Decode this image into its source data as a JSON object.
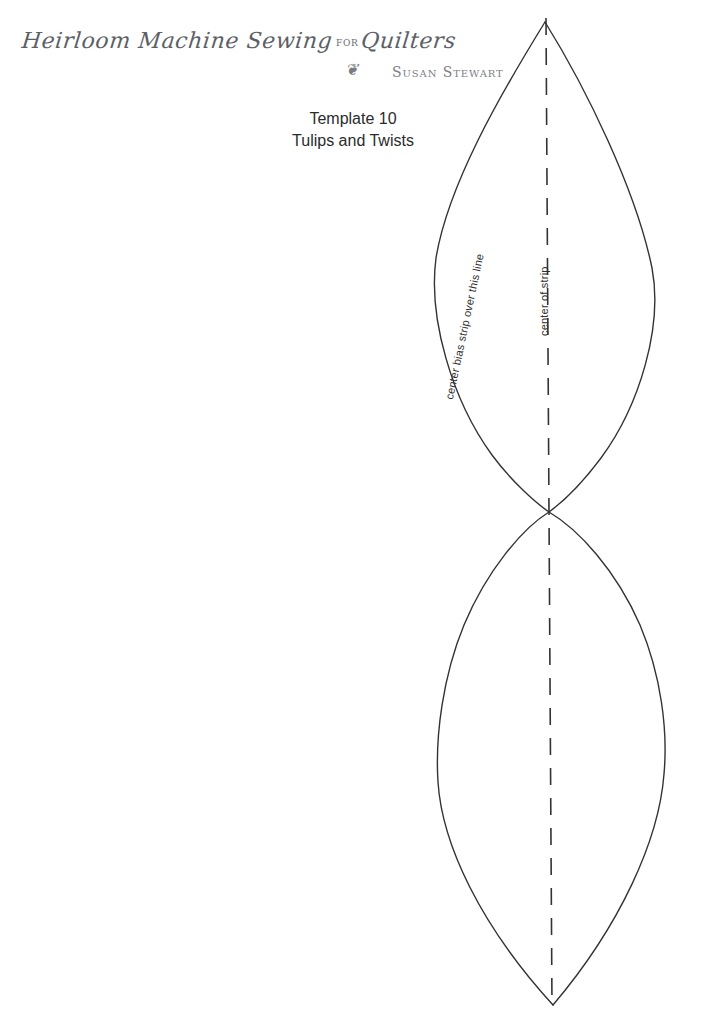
{
  "page": {
    "width": 701,
    "height": 1011,
    "background": "#ffffff",
    "ink_color": "#333333"
  },
  "header": {
    "book_title_part1": "Heirloom Machine Sewing",
    "book_title_for": "for",
    "book_title_part2": "Quilters",
    "ornament": "❦",
    "ornament_name": "floral-flourish-ornament",
    "author": "Susan Stewart"
  },
  "caption": {
    "line1": "Template 10",
    "line2": "Tulips and Twists"
  },
  "annotations": {
    "bias_label": "center bias strip over this line",
    "center_label": "center of strip"
  },
  "drawing": {
    "type": "sewing-template-outline",
    "shape_name": "double-pointed-oval-leaf-template",
    "stroke_color": "#333333",
    "stroke_width": 1.4,
    "fold_line": {
      "name": "center-of-strip-dashed-line",
      "x": 546,
      "y_start": 18,
      "y_end": 1008,
      "dash": "17 13",
      "color": "#333333"
    },
    "upper_lens": {
      "apex_top": [
        545,
        22
      ],
      "apex_bottom": [
        549,
        512
      ],
      "left_extreme": [
        435,
        262
      ],
      "right_extreme": [
        654,
        278
      ]
    },
    "lower_lens": {
      "apex_top": [
        549,
        512
      ],
      "apex_bottom": [
        553,
        1005
      ],
      "left_extreme": [
        437,
        770
      ],
      "right_extreme": [
        665,
        766
      ]
    }
  }
}
